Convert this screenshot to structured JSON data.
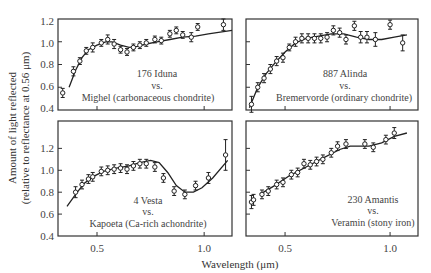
{
  "chart_data": [
    {
      "type": "scatter",
      "panel": "top-left",
      "title_lines": [
        "176 Iduna",
        "vs.",
        "Mighel (carbonaceous chondrite)"
      ],
      "asteroid": "176 Iduna",
      "meteorite": "Mighel (carbonaceous chondrite)",
      "xlim": [
        0.318,
        1.13
      ],
      "ylim": [
        0.4,
        1.2
      ],
      "xticks": [
        0.5,
        1.0
      ],
      "yticks": [
        0.4,
        0.6,
        0.8,
        1.0,
        1.2
      ],
      "points": [
        {
          "x": 0.34,
          "y": 0.55,
          "err": 0.04
        },
        {
          "x": 0.39,
          "y": 0.74,
          "err": 0.04
        },
        {
          "x": 0.42,
          "y": 0.83,
          "err": 0.03
        },
        {
          "x": 0.45,
          "y": 0.92,
          "err": 0.03
        },
        {
          "x": 0.48,
          "y": 0.95,
          "err": 0.04
        },
        {
          "x": 0.52,
          "y": 0.99,
          "err": 0.03
        },
        {
          "x": 0.55,
          "y": 1.02,
          "err": 0.04
        },
        {
          "x": 0.58,
          "y": 0.98,
          "err": 0.04
        },
        {
          "x": 0.61,
          "y": 0.93,
          "err": 0.03
        },
        {
          "x": 0.64,
          "y": 0.91,
          "err": 0.03
        },
        {
          "x": 0.67,
          "y": 0.95,
          "err": 0.03
        },
        {
          "x": 0.7,
          "y": 0.97,
          "err": 0.03
        },
        {
          "x": 0.73,
          "y": 0.99,
          "err": 0.03
        },
        {
          "x": 0.77,
          "y": 1.02,
          "err": 0.03
        },
        {
          "x": 0.8,
          "y": 1.01,
          "err": 0.03
        },
        {
          "x": 0.84,
          "y": 1.07,
          "err": 0.03
        },
        {
          "x": 0.87,
          "y": 1.1,
          "err": 0.03
        },
        {
          "x": 0.9,
          "y": 1.06,
          "err": 0.03
        },
        {
          "x": 0.94,
          "y": 1.04,
          "err": 0.04
        },
        {
          "x": 0.97,
          "y": 1.13,
          "err": 0.03
        },
        {
          "x": 1.09,
          "y": 1.15,
          "err": 0.05
        }
      ],
      "curve": [
        [
          0.37,
          0.6
        ],
        [
          0.4,
          0.75
        ],
        [
          0.43,
          0.86
        ],
        [
          0.46,
          0.93
        ],
        [
          0.5,
          0.97
        ],
        [
          0.54,
          1.0
        ],
        [
          0.57,
          1.0
        ],
        [
          0.61,
          0.97
        ],
        [
          0.65,
          0.95
        ],
        [
          0.69,
          0.96
        ],
        [
          0.73,
          0.98
        ],
        [
          0.78,
          1.0
        ],
        [
          0.84,
          1.02
        ],
        [
          0.9,
          1.04
        ],
        [
          0.96,
          1.05
        ],
        [
          1.02,
          1.07
        ],
        [
          1.13,
          1.1
        ]
      ]
    },
    {
      "type": "scatter",
      "panel": "top-right",
      "title_lines": [
        "887 Alinda",
        "vs.",
        "Bremervorde (ordinary chondrite)"
      ],
      "asteroid": "887 Alinda",
      "meteorite": "Bremervorde (ordinary chondrite)",
      "xlim": [
        0.314,
        1.133
      ],
      "ylim": [
        0.4,
        1.2
      ],
      "xticks": [
        0.5,
        1.0
      ],
      "yticks": [
        0.4,
        0.6,
        0.8,
        1.0,
        1.2
      ],
      "points": [
        {
          "x": 0.34,
          "y": 0.45,
          "err": 0.07
        },
        {
          "x": 0.37,
          "y": 0.6,
          "err": 0.04
        },
        {
          "x": 0.4,
          "y": 0.68,
          "err": 0.04
        },
        {
          "x": 0.43,
          "y": 0.76,
          "err": 0.04
        },
        {
          "x": 0.46,
          "y": 0.83,
          "err": 0.04
        },
        {
          "x": 0.49,
          "y": 0.86,
          "err": 0.04
        },
        {
          "x": 0.52,
          "y": 0.95,
          "err": 0.03
        },
        {
          "x": 0.55,
          "y": 1.0,
          "err": 0.04
        },
        {
          "x": 0.58,
          "y": 1.03,
          "err": 0.04
        },
        {
          "x": 0.61,
          "y": 1.03,
          "err": 0.04
        },
        {
          "x": 0.64,
          "y": 1.03,
          "err": 0.04
        },
        {
          "x": 0.67,
          "y": 1.03,
          "err": 0.04
        },
        {
          "x": 0.7,
          "y": 1.04,
          "err": 0.04
        },
        {
          "x": 0.73,
          "y": 1.1,
          "err": 0.04
        },
        {
          "x": 0.76,
          "y": 1.08,
          "err": 0.04
        },
        {
          "x": 0.79,
          "y": 1.02,
          "err": 0.04
        },
        {
          "x": 0.83,
          "y": 1.14,
          "err": 0.04
        },
        {
          "x": 0.86,
          "y": 1.04,
          "err": 0.05
        },
        {
          "x": 0.89,
          "y": 1.04,
          "err": 0.05
        },
        {
          "x": 0.93,
          "y": 1.02,
          "err": 0.06
        },
        {
          "x": 1.0,
          "y": 1.15,
          "err": 0.04
        },
        {
          "x": 1.06,
          "y": 0.99,
          "err": 0.07
        }
      ],
      "curve": [
        [
          0.33,
          0.42
        ],
        [
          0.37,
          0.6
        ],
        [
          0.41,
          0.72
        ],
        [
          0.45,
          0.81
        ],
        [
          0.5,
          0.91
        ],
        [
          0.55,
          0.99
        ],
        [
          0.6,
          1.03
        ],
        [
          0.66,
          1.05
        ],
        [
          0.72,
          1.07
        ],
        [
          0.78,
          1.07
        ],
        [
          0.84,
          1.04
        ],
        [
          0.9,
          1.02
        ],
        [
          0.96,
          1.02
        ],
        [
          1.02,
          1.04
        ],
        [
          1.08,
          1.06
        ]
      ]
    },
    {
      "type": "scatter",
      "panel": "bottom-left",
      "title_lines": [
        "4 Vesta",
        "vs.",
        "Kapoeta (Ca-rich achondrite)"
      ],
      "asteroid": "4 Vesta",
      "meteorite": "Kapoeta (Ca-rich achondrite)",
      "xlim": [
        0.318,
        1.13
      ],
      "ylim": [
        0.4,
        1.45
      ],
      "xticks": [
        0.5,
        1.0
      ],
      "yticks": [
        0.4,
        0.6,
        0.8,
        1.0,
        1.2
      ],
      "points": [
        {
          "x": 0.4,
          "y": 0.8,
          "err": 0.05
        },
        {
          "x": 0.43,
          "y": 0.87,
          "err": 0.04
        },
        {
          "x": 0.46,
          "y": 0.92,
          "err": 0.04
        },
        {
          "x": 0.48,
          "y": 0.94,
          "err": 0.04
        },
        {
          "x": 0.52,
          "y": 0.99,
          "err": 0.04
        },
        {
          "x": 0.55,
          "y": 1.0,
          "err": 0.04
        },
        {
          "x": 0.58,
          "y": 1.01,
          "err": 0.04
        },
        {
          "x": 0.61,
          "y": 1.02,
          "err": 0.04
        },
        {
          "x": 0.64,
          "y": 1.01,
          "err": 0.04
        },
        {
          "x": 0.67,
          "y": 1.04,
          "err": 0.04
        },
        {
          "x": 0.7,
          "y": 1.06,
          "err": 0.04
        },
        {
          "x": 0.73,
          "y": 1.06,
          "err": 0.04
        },
        {
          "x": 0.77,
          "y": 1.03,
          "err": 0.04
        },
        {
          "x": 0.81,
          "y": 0.93,
          "err": 0.04
        },
        {
          "x": 0.86,
          "y": 0.81,
          "err": 0.04
        },
        {
          "x": 0.91,
          "y": 0.78,
          "err": 0.04
        },
        {
          "x": 0.96,
          "y": 0.86,
          "err": 0.04
        },
        {
          "x": 1.02,
          "y": 0.93,
          "err": 0.05
        },
        {
          "x": 1.1,
          "y": 1.14,
          "err": 0.14
        }
      ],
      "curve": [
        [
          0.36,
          0.67
        ],
        [
          0.4,
          0.78
        ],
        [
          0.44,
          0.88
        ],
        [
          0.48,
          0.94
        ],
        [
          0.53,
          0.99
        ],
        [
          0.59,
          1.02
        ],
        [
          0.65,
          1.04
        ],
        [
          0.7,
          1.07
        ],
        [
          0.75,
          1.09
        ],
        [
          0.79,
          1.07
        ],
        [
          0.83,
          0.98
        ],
        [
          0.87,
          0.86
        ],
        [
          0.91,
          0.8
        ],
        [
          0.95,
          0.8
        ],
        [
          0.99,
          0.84
        ],
        [
          1.04,
          0.93
        ],
        [
          1.11,
          1.09
        ]
      ]
    },
    {
      "type": "scatter",
      "panel": "bottom-right",
      "title_lines": [
        "230 Amantis",
        "vs.",
        "Veramin (stony iron)"
      ],
      "asteroid": "230 Amantis",
      "meteorite": "Veramin (stony iron)",
      "xlim": [
        0.314,
        1.133
      ],
      "ylim": [
        0.4,
        1.45
      ],
      "xticks": [
        0.5,
        1.0
      ],
      "yticks": [
        0.4,
        0.6,
        0.8,
        1.0,
        1.2
      ],
      "points": [
        {
          "x": 0.34,
          "y": 0.71,
          "err": 0.06
        },
        {
          "x": 0.35,
          "y": 0.73,
          "err": 0.05
        },
        {
          "x": 0.39,
          "y": 0.78,
          "err": 0.04
        },
        {
          "x": 0.42,
          "y": 0.81,
          "err": 0.04
        },
        {
          "x": 0.46,
          "y": 0.87,
          "err": 0.04
        },
        {
          "x": 0.49,
          "y": 0.89,
          "err": 0.04
        },
        {
          "x": 0.53,
          "y": 0.96,
          "err": 0.04
        },
        {
          "x": 0.56,
          "y": 0.98,
          "err": 0.04
        },
        {
          "x": 0.59,
          "y": 1.06,
          "err": 0.04
        },
        {
          "x": 0.62,
          "y": 1.05,
          "err": 0.04
        },
        {
          "x": 0.65,
          "y": 1.08,
          "err": 0.04
        },
        {
          "x": 0.68,
          "y": 1.1,
          "err": 0.04
        },
        {
          "x": 0.72,
          "y": 1.16,
          "err": 0.04
        },
        {
          "x": 0.75,
          "y": 1.22,
          "err": 0.04
        },
        {
          "x": 0.79,
          "y": 1.24,
          "err": 0.04
        },
        {
          "x": 0.88,
          "y": 1.24,
          "err": 0.04
        },
        {
          "x": 0.92,
          "y": 1.21,
          "err": 0.04
        },
        {
          "x": 0.98,
          "y": 1.28,
          "err": 0.04
        },
        {
          "x": 1.02,
          "y": 1.34,
          "err": 0.05
        }
      ],
      "curve": [
        [
          0.38,
          0.78
        ],
        [
          0.45,
          0.86
        ],
        [
          0.52,
          0.95
        ],
        [
          0.6,
          1.03
        ],
        [
          0.68,
          1.11
        ],
        [
          0.76,
          1.19
        ],
        [
          0.81,
          1.22
        ],
        [
          0.9,
          1.22
        ],
        [
          0.96,
          1.25
        ],
        [
          1.02,
          1.31
        ],
        [
          1.08,
          1.34
        ]
      ]
    }
  ],
  "axes": {
    "xlabel": "Wavelength (μm)",
    "ylabel_line1": "Amount of light reflected",
    "ylabel_line2": "(relative to reflectance at 0.56 μm)",
    "xtick_labels": [
      "0.5",
      "1.0"
    ],
    "ytick_labels": [
      "0.4",
      "0.6",
      "0.8",
      "1.0",
      "1.2"
    ]
  },
  "panels": {
    "top_left": {
      "line1": "176 Iduna",
      "line2": "vs.",
      "line3": "Mighel (carbonaceous chondrite)"
    },
    "top_right": {
      "line1": "887 Alinda",
      "line2": "vs.",
      "line3": "Bremervorde (ordinary chondrite)"
    },
    "bottom_left": {
      "line1": "4 Vesta",
      "line2": "vs.",
      "line3": "Kapoeta (Ca-rich achondrite)"
    },
    "bottom_right": {
      "line1": "230 Amantis",
      "line2": "vs.",
      "line3": "Veramin (stony iron)"
    }
  }
}
